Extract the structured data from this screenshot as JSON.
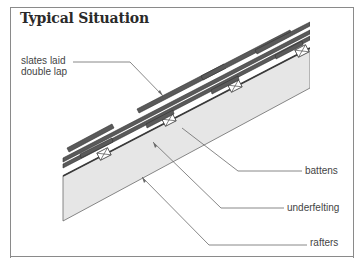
{
  "title": "Typical Situation",
  "labels": {
    "slates": [
      "slates laid",
      "double lap"
    ],
    "battens": "battens",
    "underfelting": "underfelting",
    "rafters": "rafters"
  },
  "colors": {
    "slate": "#5a5a5a",
    "rafter_fill": "#e6e6e6",
    "line": "#6a6a6a",
    "frame": "#8a8a8a"
  }
}
